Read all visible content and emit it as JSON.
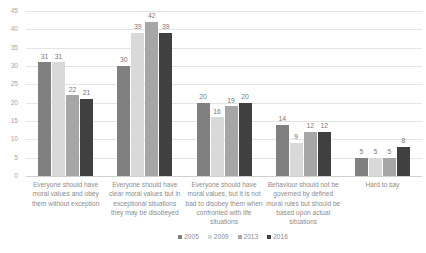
{
  "chart_data": {
    "type": "bar",
    "title": "",
    "xlabel": "",
    "ylabel": "",
    "ylim": [
      0,
      45
    ],
    "y_ticks": [
      0,
      5,
      10,
      15,
      20,
      25,
      30,
      35,
      40,
      45
    ],
    "grid": true,
    "legend_position": "bottom",
    "grouping": "clustered",
    "categories": [
      "Everyone should have moral values and obey them without exception",
      "Everyone should have clear moral values but in exceptional situations they may be disobeyed",
      "Everyone should have moral values, but it is not bad to disobey them when confronted with life situations",
      "Behaviour should not be governed by defined moral rules but should be based upon actual situations",
      "Hard to say"
    ],
    "series": [
      {
        "name": "2005",
        "color": "#808080",
        "values": [
          31,
          30,
          20,
          14,
          5
        ]
      },
      {
        "name": "2009",
        "color": "#d9d9d9",
        "values": [
          31,
          39,
          16,
          9,
          5
        ]
      },
      {
        "name": "2013",
        "color": "#a6a6a6",
        "values": [
          22,
          42,
          19,
          12,
          5
        ]
      },
      {
        "name": "2016",
        "color": "#404040",
        "values": [
          21,
          39,
          20,
          12,
          8
        ]
      }
    ]
  },
  "colors": {
    "gridline": "#e4e4e4",
    "tick_label": "#a6a6a6",
    "data_label": "#7a7a7a",
    "category_label": "#8c8c8c",
    "legend_label": "#8c8c8c",
    "background": "#ffffff"
  }
}
